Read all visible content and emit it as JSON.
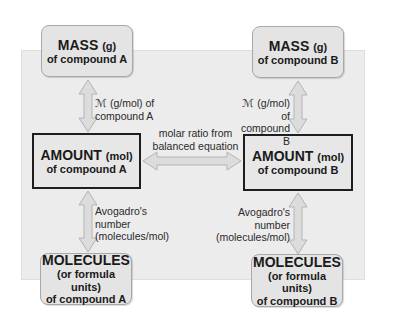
{
  "boxes": {
    "mass_a": {
      "title": "MASS",
      "unit": "(g)",
      "lines": [
        "of compound A"
      ]
    },
    "mass_b": {
      "title": "MASS",
      "unit": "(g)",
      "lines": [
        "of compound B"
      ]
    },
    "amount_a": {
      "title": "AMOUNT",
      "unit": "(mol)",
      "lines": [
        "of compound A"
      ]
    },
    "amount_b": {
      "title": "AMOUNT",
      "unit": "(mol)",
      "lines": [
        "of compound B"
      ]
    },
    "molecules_a": {
      "title": "MOLECULES",
      "lines": [
        "(or formula units)",
        "of compound A"
      ]
    },
    "molecules_b": {
      "title": "MOLECULES",
      "lines": [
        "(or formula units)",
        "of compound B"
      ]
    }
  },
  "conversions": {
    "molar_mass_a": [
      "ℳ (g/mol) of",
      "compound A"
    ],
    "molar_mass_b": [
      "ℳ (g/mol) of",
      "compound B"
    ],
    "molar_ratio": [
      "molar ratio from",
      "balanced equation"
    ],
    "avogadro_a": [
      "Avogadro's",
      "number",
      "(molecules/mol)"
    ],
    "avogadro_b": [
      "Avogadro's",
      "number",
      "(molecules/mol)"
    ]
  },
  "colors": {
    "panel": "#ececec",
    "box_fill": "#e4e4e4",
    "arrow_fill": "#dcdcdc",
    "arrow_stroke": "#b4b4b4",
    "strong_border": "#1e1e1e"
  }
}
